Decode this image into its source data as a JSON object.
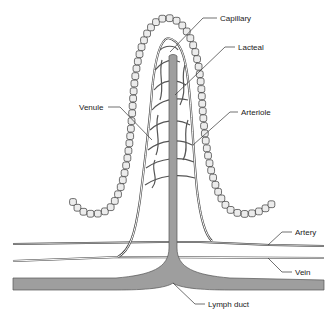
{
  "diagram": {
    "labels": {
      "capillary": "Capillary",
      "lacteal": "Lacteal",
      "venule": "Venule",
      "arteriole": "Arteriole",
      "artery": "Artery",
      "vein": "Vein",
      "lymph_duct": "Lymph duct"
    },
    "colors": {
      "lymph": "#9e9e9e",
      "epithelium_cell": "#ececec",
      "outline": "#333333",
      "background": "#ffffff"
    }
  }
}
